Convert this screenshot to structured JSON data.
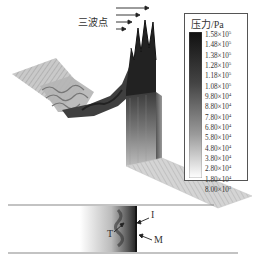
{
  "chart_data": {
    "type": "surface3d",
    "title": "",
    "annotations": {
      "triple_point": "三波点",
      "incident_wave": "I",
      "reflected_wave": "T",
      "mach_stem": "M"
    },
    "colorbar": {
      "title": "压力/Pa",
      "levels": [
        {
          "mantissa": "1.58",
          "exp": "5"
        },
        {
          "mantissa": "1.48",
          "exp": "5"
        },
        {
          "mantissa": "1.38",
          "exp": "5"
        },
        {
          "mantissa": "1.28",
          "exp": "5"
        },
        {
          "mantissa": "1.18",
          "exp": "5"
        },
        {
          "mantissa": "1.08",
          "exp": "5"
        },
        {
          "mantissa": "9.80",
          "exp": "4"
        },
        {
          "mantissa": "8.80",
          "exp": "4"
        },
        {
          "mantissa": "7.80",
          "exp": "4"
        },
        {
          "mantissa": "6.80",
          "exp": "4"
        },
        {
          "mantissa": "5.80",
          "exp": "4"
        },
        {
          "mantissa": "4.80",
          "exp": "4"
        },
        {
          "mantissa": "3.80",
          "exp": "4"
        },
        {
          "mantissa": "2.80",
          "exp": "4"
        },
        {
          "mantissa": "1.80",
          "exp": "4"
        }
      ],
      "min_label": {
        "mantissa": "8.00",
        "exp": "3"
      },
      "values_pa": [
        158000,
        148000,
        138000,
        128000,
        118000,
        108000,
        98000,
        88000,
        78000,
        68000,
        58000,
        48000,
        38000,
        28000,
        18000,
        8000
      ],
      "colormap": "grayscale (dark = high, light = low)"
    },
    "peaks": 4,
    "arrows_count": 4
  },
  "legend": {
    "title": "压力/Pa",
    "times": "×10"
  },
  "labels": {
    "triple_point": "三波点",
    "I": "I",
    "T": "T",
    "M": "M"
  }
}
